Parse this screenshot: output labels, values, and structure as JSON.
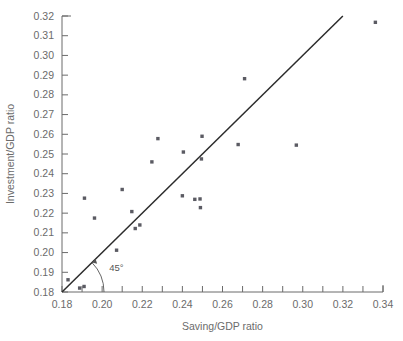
{
  "chart_data": {
    "type": "scatter",
    "title": "",
    "xlabel": "Saving/GDP ratio",
    "ylabel": "Investment/GDP ratio",
    "xlim": [
      0.18,
      0.34
    ],
    "ylim": [
      0.18,
      0.32
    ],
    "xticks": [
      0.18,
      0.19,
      0.2,
      0.21,
      0.22,
      0.23,
      0.24,
      0.25,
      0.26,
      0.27,
      0.28,
      0.29,
      0.3,
      0.31,
      0.32,
      0.33,
      0.34
    ],
    "xtick_labels": [
      "0.18",
      "",
      "0.20",
      "",
      "0.22",
      "",
      "0.24",
      "",
      "0.26",
      "",
      "0.28",
      "",
      "0.30",
      "",
      "0.32",
      "",
      "0.34"
    ],
    "yticks": [
      0.18,
      0.19,
      0.2,
      0.21,
      0.22,
      0.23,
      0.24,
      0.25,
      0.26,
      0.27,
      0.28,
      0.29,
      0.3,
      0.31,
      0.32
    ],
    "ytick_labels": [
      "0.18",
      "0.19",
      "0.20",
      "0.21",
      "0.22",
      "0.23",
      "0.24",
      "0.25",
      "0.26",
      "0.27",
      "0.28",
      "0.29",
      "0.30",
      "0.31",
      "0.32"
    ],
    "grid": false,
    "legend": "none",
    "marker_color": "#5b5b63",
    "line_color": "#2b2b2b",
    "axis_color": "#6b6b6b",
    "reference_line": {
      "label": "45°",
      "slope": 1,
      "intercept": 0,
      "x_start": 0.18,
      "y_start": 0.18,
      "x_end": 0.32,
      "y_end": 0.32
    },
    "annotations": [
      {
        "text": "45°",
        "x": 0.2035,
        "y": 0.1905
      }
    ],
    "points": [
      {
        "x": 0.183,
        "y": 0.1862
      },
      {
        "x": 0.1888,
        "y": 0.182
      },
      {
        "x": 0.191,
        "y": 0.1828
      },
      {
        "x": 0.1912,
        "y": 0.2276
      },
      {
        "x": 0.1962,
        "y": 0.2175
      },
      {
        "x": 0.2072,
        "y": 0.2012
      },
      {
        "x": 0.21,
        "y": 0.232
      },
      {
        "x": 0.2148,
        "y": 0.2208
      },
      {
        "x": 0.2165,
        "y": 0.2122
      },
      {
        "x": 0.2188,
        "y": 0.214
      },
      {
        "x": 0.2248,
        "y": 0.246
      },
      {
        "x": 0.2278,
        "y": 0.2578
      },
      {
        "x": 0.24,
        "y": 0.2288
      },
      {
        "x": 0.2405,
        "y": 0.251
      },
      {
        "x": 0.2462,
        "y": 0.227
      },
      {
        "x": 0.2488,
        "y": 0.2272
      },
      {
        "x": 0.249,
        "y": 0.2228
      },
      {
        "x": 0.2495,
        "y": 0.2475
      },
      {
        "x": 0.2498,
        "y": 0.259
      },
      {
        "x": 0.2678,
        "y": 0.2548
      },
      {
        "x": 0.271,
        "y": 0.2882
      },
      {
        "x": 0.2968,
        "y": 0.2545
      },
      {
        "x": 0.3362,
        "y": 0.3168
      }
    ]
  }
}
